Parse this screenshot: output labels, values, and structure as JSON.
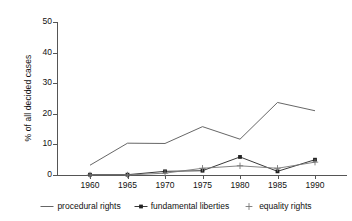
{
  "chart_data": {
    "type": "line",
    "title": "",
    "xlabel": "",
    "ylabel": "% of all decided cases",
    "x": [
      1960,
      1965,
      1970,
      1975,
      1980,
      1985,
      1990
    ],
    "xtick_labels": [
      "1960",
      "1965",
      "1970",
      "1975",
      "1980",
      "1985",
      "1990"
    ],
    "ytick_labels": [
      "0",
      "10",
      "20",
      "30",
      "40",
      "50"
    ],
    "yticks": [
      0,
      10,
      20,
      30,
      40,
      50
    ],
    "ylim": [
      0,
      50
    ],
    "xlim": [
      1957,
      1995
    ],
    "grid": false,
    "legend_position": "below",
    "series": [
      {
        "name": "procedural rights",
        "marker": "none",
        "color": "#555555",
        "values": [
          3.2,
          10.4,
          10.3,
          15.8,
          11.7,
          23.7,
          21.0
        ]
      },
      {
        "name": "fundamental liberties",
        "marker": "filled-square",
        "color": "#222222",
        "values": [
          0.1,
          0.1,
          1.2,
          1.4,
          5.9,
          1.2,
          5.0
        ]
      },
      {
        "name": "equality rights",
        "marker": "plus",
        "color": "#777777",
        "values": [
          0.0,
          0.0,
          0.6,
          2.2,
          3.0,
          2.2,
          4.2
        ]
      }
    ]
  },
  "axes": {
    "y_label": "% of all decided cases"
  },
  "legend": {
    "items": [
      {
        "label": "procedural rights",
        "marker": "line"
      },
      {
        "label": "fundamental liberties",
        "marker": "line-filled-square"
      },
      {
        "label": "equality rights",
        "marker": "plus"
      }
    ]
  }
}
